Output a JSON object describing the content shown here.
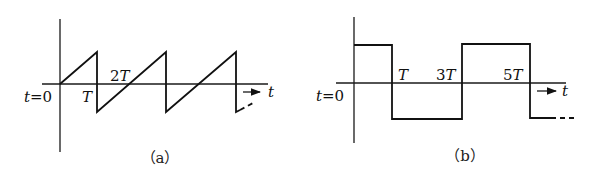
{
  "figures": [
    {
      "id": "a",
      "caption": "（a）",
      "waveform": "sawtooth",
      "origin_label": "t=0",
      "axis_label": "t",
      "tick_labels": [
        "T",
        "2T"
      ],
      "colors": {
        "stroke": "#111111"
      }
    },
    {
      "id": "b",
      "caption": "（b）",
      "waveform": "square",
      "origin_label": "t=0",
      "axis_label": "t",
      "tick_labels": [
        "T",
        "3T",
        "5T"
      ],
      "colors": {
        "stroke": "#111111"
      }
    }
  ]
}
